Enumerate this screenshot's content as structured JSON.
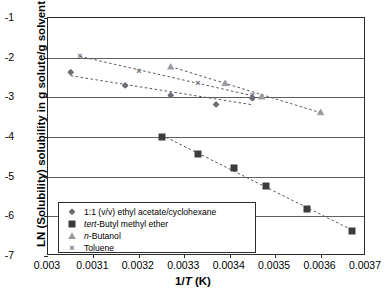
{
  "chart_data": {
    "type": "scatter",
    "title": "",
    "xlabel": "1/T (K)",
    "ylabel": "LN (Solubility) solubility in g solute/g solvent",
    "xlim": [
      0.003,
      0.0037
    ],
    "ylim": [
      -7,
      -1
    ],
    "grid": true,
    "legend_position": "lower-left-inside",
    "xticks": [
      "0.003",
      "0.0031",
      "0.0032",
      "0.0033",
      "0.0034",
      "0.0035",
      "0.0036",
      "0.0037"
    ],
    "xtick_values": [
      0.003,
      0.0031,
      0.0032,
      0.0033,
      0.0034,
      0.0035,
      0.0036,
      0.0037
    ],
    "yticks": [
      "-1",
      "-2",
      "-3",
      "-4",
      "-5",
      "-6",
      "-7"
    ],
    "ytick_values": [
      -1,
      -2,
      -3,
      -4,
      -5,
      -6,
      -7
    ],
    "series": [
      {
        "name": "1:1 (v/v) ethyl acetate/cyclohexane",
        "name_parts": [
          {
            "text": "1:1 (v/v) ethyl acetate/cyclohexane",
            "italic": false
          }
        ],
        "marker": "diamond",
        "color": "#6d6d75",
        "trendline": true,
        "x": [
          0.00305,
          0.00317,
          0.00327,
          0.00337,
          0.00345
        ],
        "y": [
          -2.37,
          -2.7,
          -2.95,
          -3.18,
          -3.02
        ]
      },
      {
        "name": "tert-Butyl methyl ether",
        "name_parts": [
          {
            "text": "tert",
            "italic": true
          },
          {
            "text": "-Butyl methyl ether",
            "italic": false
          }
        ],
        "marker": "square",
        "color": "#3d3d3d",
        "trendline": true,
        "x": [
          0.00325,
          0.00333,
          0.00341,
          0.00348,
          0.00357,
          0.00367
        ],
        "y": [
          -4.0,
          -4.43,
          -4.77,
          -5.23,
          -5.82,
          -6.37
        ]
      },
      {
        "name": "n-Butanol",
        "name_parts": [
          {
            "text": "n",
            "italic": true
          },
          {
            "text": "-Butanol",
            "italic": false
          }
        ],
        "marker": "triangle",
        "color": "#9a9aa0",
        "trendline": true,
        "x": [
          0.00327,
          0.00339,
          0.00347,
          0.0036
        ],
        "y": [
          -2.22,
          -2.63,
          -2.97,
          -3.37
        ]
      },
      {
        "name": "Toluene",
        "name_parts": [
          {
            "text": "Toluene",
            "italic": false
          }
        ],
        "marker": "cross",
        "color": "#6a6a72",
        "trendline": true,
        "x": [
          0.00307,
          0.0032,
          0.00333,
          0.00345
        ],
        "y": [
          -1.95,
          -2.33,
          -2.65,
          -2.95
        ]
      }
    ]
  },
  "axis": {
    "x_title_pre": "1/",
    "x_title_italic": "T",
    "x_title_post": " (K)",
    "y_title": "LN (Solubility) solubility in g solute/g solvent"
  }
}
